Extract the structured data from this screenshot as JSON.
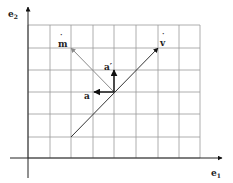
{
  "diagram": {
    "type": "vector-grid",
    "background": "#ffffff",
    "grid": {
      "color": "#9a9a9a",
      "x_lines": [
        28,
        50,
        71,
        93,
        114,
        136,
        158,
        179,
        200
      ],
      "y_lines": [
        25,
        48,
        70,
        92,
        114,
        137,
        158
      ],
      "x_min": 28,
      "x_max": 200,
      "y_min": 25,
      "y_max": 158
    },
    "axes": {
      "color": "#222222",
      "e1": {
        "label": "e",
        "sub": "1",
        "x1": 10,
        "y1": 158,
        "x2": 222,
        "y2": 158,
        "label_x": 211,
        "label_y": 176
      },
      "e2": {
        "label": "e",
        "sub": "2",
        "x1": 28,
        "y1": 178,
        "x2": 28,
        "y2": 7,
        "label_x": 8,
        "label_y": 17
      }
    },
    "vectors": [
      {
        "name": "v",
        "label": "v",
        "hat": "˙",
        "color": "#333333",
        "x1": 71,
        "y1": 137,
        "x2": 158,
        "y2": 48,
        "label_x": 160,
        "label_y": 46
      },
      {
        "name": "m",
        "label": "m",
        "hat": "˙",
        "color": "#8a8a8a",
        "x1": 114,
        "y1": 92,
        "x2": 71,
        "y2": 48,
        "label_x": 58,
        "label_y": 47
      },
      {
        "name": "a",
        "label": "a",
        "color": "#111111",
        "x1": 114,
        "y1": 92,
        "x2": 94,
        "y2": 92,
        "label_x": 84,
        "label_y": 99
      },
      {
        "name": "a-prime",
        "label": "a′",
        "color": "#111111",
        "x1": 114,
        "y1": 92,
        "x2": 114,
        "y2": 70,
        "label_x": 104,
        "label_y": 70
      }
    ]
  }
}
